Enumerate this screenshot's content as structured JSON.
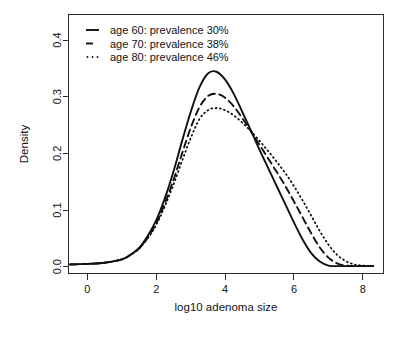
{
  "chart_data": {
    "type": "line",
    "title": "",
    "xlabel": "log10 adenoma size",
    "ylabel": "Density",
    "xlim": [
      -0.55,
      8.6
    ],
    "ylim": [
      -0.012,
      0.445
    ],
    "xticks": [
      0,
      2,
      4,
      6,
      8
    ],
    "xticklabels": [
      "0",
      "2",
      "4",
      "6",
      "8"
    ],
    "yticks": [
      0.0,
      0.1,
      0.2,
      0.3,
      0.4
    ],
    "yticklabels": [
      "0.0",
      "0.1",
      "0.2",
      "0.3",
      "0.4"
    ],
    "grid": false,
    "legend_position": "top-left",
    "x": [
      -0.5,
      0.0,
      0.5,
      1.0,
      1.25,
      1.5,
      1.75,
      2.0,
      2.25,
      2.5,
      2.75,
      3.0,
      3.25,
      3.5,
      3.75,
      4.0,
      4.25,
      4.5,
      4.75,
      5.0,
      5.25,
      5.5,
      5.75,
      6.0,
      6.25,
      6.5,
      6.75,
      7.0,
      7.25,
      7.5,
      7.75,
      8.0,
      8.3
    ],
    "series": [
      {
        "name": "age 60: prevalence 30%",
        "style": "solid",
        "values": [
          0.004,
          0.005,
          0.007,
          0.013,
          0.021,
          0.033,
          0.054,
          0.082,
          0.121,
          0.168,
          0.222,
          0.273,
          0.316,
          0.341,
          0.344,
          0.33,
          0.305,
          0.273,
          0.24,
          0.206,
          0.174,
          0.142,
          0.11,
          0.078,
          0.048,
          0.024,
          0.009,
          0.002,
          0.001,
          0.001,
          0.001,
          0.001,
          0.001
        ]
      },
      {
        "name": "age 70: prevalence 38%",
        "style": "dashed",
        "values": [
          0.004,
          0.005,
          0.007,
          0.013,
          0.021,
          0.032,
          0.051,
          0.077,
          0.112,
          0.153,
          0.2,
          0.245,
          0.281,
          0.301,
          0.305,
          0.298,
          0.283,
          0.262,
          0.239,
          0.215,
          0.191,
          0.167,
          0.142,
          0.115,
          0.087,
          0.059,
          0.034,
          0.016,
          0.006,
          0.002,
          0.001,
          0.001,
          0.001
        ]
      },
      {
        "name": "age 80: prevalence 46%",
        "style": "dotted",
        "values": [
          0.004,
          0.005,
          0.007,
          0.013,
          0.021,
          0.032,
          0.05,
          0.074,
          0.107,
          0.145,
          0.187,
          0.227,
          0.26,
          0.276,
          0.28,
          0.276,
          0.267,
          0.254,
          0.239,
          0.222,
          0.204,
          0.185,
          0.165,
          0.142,
          0.117,
          0.09,
          0.063,
          0.039,
          0.021,
          0.01,
          0.004,
          0.002,
          0.001
        ]
      }
    ]
  },
  "legend": {
    "entries": [
      {
        "label": "age 60: prevalence 30%",
        "style": "solid"
      },
      {
        "label": "age 70: prevalence 38%",
        "style": "dashed"
      },
      {
        "label": "age 80: prevalence 46%",
        "style": "dotted"
      }
    ]
  },
  "axes": {
    "x_title": "log10 adenoma size",
    "y_title": "Density"
  },
  "colors": {
    "line": "#101010",
    "axis": "#2b2b2b",
    "background": "#ffffff"
  }
}
